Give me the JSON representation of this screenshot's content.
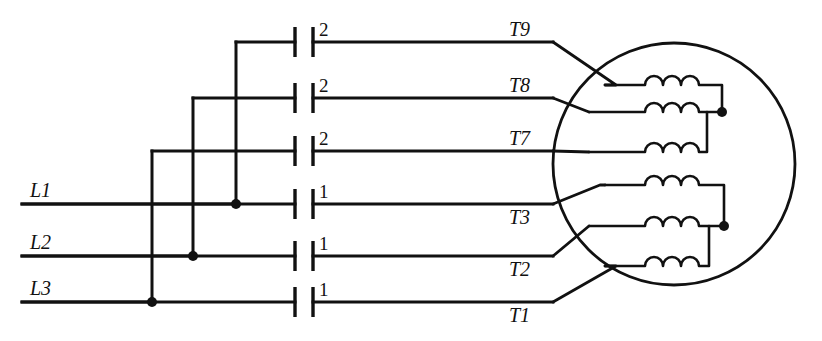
{
  "diagram": {
    "type": "electrical-schematic",
    "canvas": {
      "width": 822,
      "height": 341,
      "background": "#ffffff"
    },
    "ink_color": "#111111",
    "supply_lines": [
      {
        "id": "L1",
        "label": "L1",
        "y": 204,
        "x_start": 22,
        "x_end": 152,
        "label_x": 30,
        "label_y": 197
      },
      {
        "id": "L2",
        "label": "L2",
        "y": 256,
        "x_start": 22,
        "x_end": 193,
        "label_x": 30,
        "label_y": 249
      },
      {
        "id": "L3",
        "label": "L3",
        "y": 302,
        "x_start": 22,
        "x_end": 236,
        "label_x": 30,
        "label_y": 295
      }
    ],
    "risers": [
      {
        "id": "riser-L1",
        "x": 236,
        "from_y": 204,
        "to_y": 42,
        "source": "L1",
        "feeds_row": 1
      },
      {
        "id": "riser-L2",
        "x": 193,
        "from_y": 256,
        "to_y": 98,
        "source": "L2",
        "feeds_row": 2
      },
      {
        "id": "riser-L3",
        "x": 152,
        "from_y": 302,
        "to_y": 151,
        "source": "L3",
        "feeds_row": 3
      }
    ],
    "junction_dots": [
      {
        "id": "dot-L1",
        "x": 236,
        "y": 204
      },
      {
        "id": "dot-L2",
        "x": 193,
        "y": 256
      },
      {
        "id": "dot-L3",
        "x": 152,
        "y": 302
      },
      {
        "id": "dot-winding-group-upper",
        "x": 722,
        "y": 112
      },
      {
        "id": "dot-winding-group-lower",
        "x": 724,
        "y": 226
      }
    ],
    "rows": [
      {
        "index": 1,
        "y": 42,
        "contactor_label": "2",
        "terminal": "T9",
        "terminal_label_pos": "above",
        "wire_left_x": 236,
        "wire_right_x": 553
      },
      {
        "index": 2,
        "y": 98,
        "contactor_label": "2",
        "terminal": "T8",
        "terminal_label_pos": "above",
        "wire_left_x": 193,
        "wire_right_x": 553
      },
      {
        "index": 3,
        "y": 151,
        "contactor_label": "2",
        "terminal": "T7",
        "terminal_label_pos": "above",
        "wire_left_x": 152,
        "wire_right_x": 553
      },
      {
        "index": 4,
        "y": 204,
        "contactor_label": "1",
        "terminal": "T3",
        "terminal_label_pos": "below",
        "wire_left_x": 22,
        "wire_right_x": 553
      },
      {
        "index": 5,
        "y": 256,
        "contactor_label": "1",
        "terminal": "T2",
        "terminal_label_pos": "below",
        "wire_left_x": 22,
        "wire_right_x": 553
      },
      {
        "index": 6,
        "y": 302,
        "contactor_label": "1",
        "terminal": "T1",
        "terminal_label_pos": "below",
        "wire_left_x": 22,
        "wire_right_x": 553
      }
    ],
    "contactor": {
      "name": "capacitor-style-contact",
      "left_bar_x": 295,
      "right_bar_x": 313,
      "bar_half_height": 15,
      "label_offset_x": 6,
      "label_offset_y": -10,
      "labels_top_group": "2",
      "labels_bottom_group": "1"
    },
    "motor": {
      "name": "motor-body",
      "center_x": 674,
      "center_y": 164,
      "radius": 121
    },
    "windings": [
      {
        "id": "winding-T9",
        "group": "upper",
        "y": 70,
        "terminal": "T9",
        "lead_row": 1,
        "left_x": 605,
        "right_x": 722,
        "coil_start_x": 645,
        "coil_end_x": 700
      },
      {
        "id": "winding-T8",
        "group": "upper",
        "y": 112,
        "terminal": "T8",
        "lead_row": 2,
        "left_x": 588,
        "right_x": 722,
        "coil_start_x": 645,
        "coil_end_x": 700
      },
      {
        "id": "winding-T7",
        "group": "upper",
        "y": 152,
        "terminal": "T7",
        "lead_row": 3,
        "left_x": 605,
        "right_x": 722,
        "coil_start_x": 645,
        "coil_end_x": 700
      },
      {
        "id": "winding-T3",
        "group": "lower",
        "y": 185,
        "terminal": "T3",
        "lead_row": 4,
        "left_x": 605,
        "right_x": 724,
        "coil_start_x": 645,
        "coil_end_x": 700
      },
      {
        "id": "winding-T2",
        "group": "lower",
        "y": 226,
        "terminal": "T2",
        "lead_row": 5,
        "left_x": 588,
        "right_x": 724,
        "coil_start_x": 645,
        "coil_end_x": 700
      },
      {
        "id": "winding-T1",
        "group": "lower",
        "y": 266,
        "terminal": "T1",
        "lead_row": 6,
        "left_x": 605,
        "right_x": 724,
        "coil_start_x": 645,
        "coil_end_x": 700
      }
    ],
    "leads": [
      {
        "id": "lead-T9",
        "terminal": "T9",
        "points": "553,42 613,85"
      },
      {
        "id": "lead-T8",
        "terminal": "T8",
        "points": "553,98 588,112"
      },
      {
        "id": "lead-T7",
        "terminal": "T7",
        "points": "553,151 588,152"
      },
      {
        "id": "lead-T3",
        "terminal": "T3",
        "points": "553,204 597,185"
      },
      {
        "id": "lead-T2",
        "terminal": "T2",
        "points": "553,256 588,226"
      },
      {
        "id": "lead-T1",
        "terminal": "T1",
        "points": "553,302 616,268"
      }
    ],
    "terminal_labels": [
      {
        "text": "T9",
        "x": 509,
        "y": 36
      },
      {
        "text": "T8",
        "x": 509,
        "y": 92
      },
      {
        "text": "T7",
        "x": 509,
        "y": 145
      },
      {
        "text": "T3",
        "x": 509,
        "y": 224
      },
      {
        "text": "T2",
        "x": 509,
        "y": 276
      },
      {
        "text": "T1",
        "x": 509,
        "y": 322
      }
    ]
  }
}
